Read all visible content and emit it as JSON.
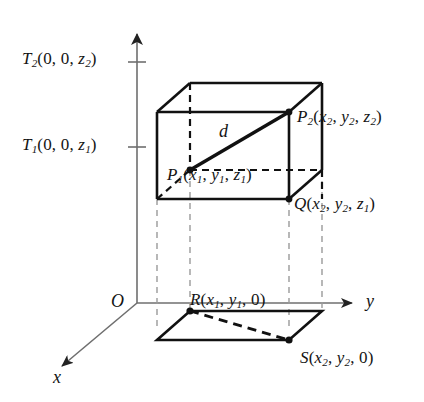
{
  "figure": {
    "background": "#ffffff",
    "stroke_solid": "#111111",
    "stroke_dashed_box": "#111111",
    "stroke_projection": "#9a9a9a",
    "axis_color": "#6f6f6f"
  },
  "axes": {
    "x_label": "x",
    "y_label": "y",
    "origin_label": "O",
    "z_tick_upper_label": "T",
    "z_tick_lower_label": "T"
  },
  "labels": {
    "T2": {
      "name": "T",
      "sub": "2",
      "coords": "(0, 0, z",
      "coord_sub": "2",
      "close": ")"
    },
    "T1": {
      "name": "T",
      "sub": "1",
      "coords": "(0, 0, z",
      "coord_sub": "1",
      "close": ")"
    },
    "P2": {
      "name": "P",
      "sub": "2",
      "open": "(",
      "c1": "x",
      "c1s": "2",
      "c2": "y",
      "c2s": "2",
      "c3": "z",
      "c3s": "2",
      "close": ")"
    },
    "P1": {
      "name": "P",
      "sub": "1",
      "open": "(",
      "c1": "x",
      "c1s": "1",
      "c2": "y",
      "c2s": "1",
      "c3": "z",
      "c3s": "1",
      "close": ")"
    },
    "Q": {
      "name": "Q",
      "sub": "",
      "open": "(",
      "c1": "x",
      "c1s": "2",
      "c2": "y",
      "c2s": "2",
      "c3": "z",
      "c3s": "1",
      "close": ")"
    },
    "R": {
      "name": "R",
      "sub": "",
      "open": "(",
      "c1": "x",
      "c1s": "1",
      "c2": "y",
      "c2s": "1",
      "c3": "0",
      "c3s": "",
      "close": ")"
    },
    "S": {
      "name": "S",
      "sub": "",
      "open": "(",
      "c1": "x",
      "c1s": "2",
      "c2": "y",
      "c2s": "2",
      "c3": "0",
      "c3s": "",
      "close": ")"
    },
    "d": {
      "name": "d"
    }
  },
  "text": {
    "T2_full": "T2(0, 0, z2)",
    "T1_full": "T1(0, 0, z1)",
    "P2_full": "P2(x2, y2, z2)",
    "P1_full": "P1(x1, y1, z1)",
    "Q_full": "Q(x2, y2, z1)",
    "R_full": "R(x1, y1, 0)",
    "S_full": "S(x2, y2, 0)",
    "d_full": "d",
    "x_full": "x",
    "y_full": "y",
    "O_full": "O"
  }
}
